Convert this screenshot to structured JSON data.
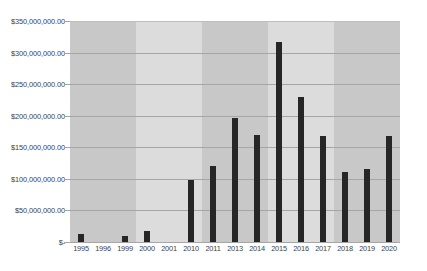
{
  "chart_data": {
    "type": "bar",
    "title": "",
    "xlabel": "",
    "ylabel": "",
    "categories": [
      "1995",
      "1996",
      "1999",
      "2000",
      "2001",
      "2010",
      "2011",
      "2013",
      "2014",
      "2015",
      "2016",
      "2017",
      "2018",
      "2019",
      "2020"
    ],
    "values": [
      12700000,
      0,
      9000000,
      17000000,
      0,
      99000000,
      121000000,
      197000000,
      170000000,
      317000000,
      230000000,
      168000000,
      111000000,
      116000000,
      168000000
    ],
    "ylim": [
      0,
      350000000
    ],
    "ytick_values": [
      0,
      50000000,
      100000000,
      150000000,
      200000000,
      250000000,
      300000000,
      350000000
    ],
    "ytick_labels": [
      "$-",
      "$50,000,000.00",
      "$100,000,000.00",
      "$150,000,000.00",
      "$200,000,000.00",
      "$250,000,000.00",
      "$300,000,000.00",
      "$350,000,000.00"
    ],
    "grid": true,
    "legend": false,
    "legend_position": "none",
    "series": [
      {
        "name": "",
        "values": [
          12700000,
          0,
          9000000,
          17000000,
          0,
          99000000,
          121000000,
          197000000,
          170000000,
          317000000,
          230000000,
          168000000,
          111000000,
          116000000,
          168000000
        ]
      }
    ],
    "colors": {
      "bar": "#262626",
      "gridline": "#a6a6a6",
      "band_dark": "#c8c8c8",
      "band_light": "#dcdcdc",
      "plot_background": "#ffffff",
      "text": "#3f3f3f"
    },
    "background_bands": [
      {
        "span": 3,
        "shade": "dark"
      },
      {
        "span": 3,
        "shade": "light"
      },
      {
        "span": 3,
        "shade": "dark"
      },
      {
        "span": 3,
        "shade": "light"
      },
      {
        "span": 3,
        "shade": "dark"
      }
    ]
  }
}
